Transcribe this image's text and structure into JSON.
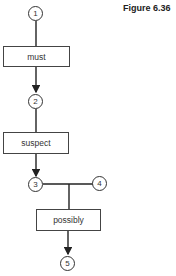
{
  "figure": {
    "title": "Figure 6.36"
  },
  "nodes": [
    {
      "id": "1",
      "label": "1"
    },
    {
      "id": "2",
      "label": "2"
    },
    {
      "id": "3",
      "label": "3"
    },
    {
      "id": "4",
      "label": "4"
    },
    {
      "id": "5",
      "label": "5"
    }
  ],
  "boxes": [
    {
      "label": "must"
    },
    {
      "label": "suspect"
    },
    {
      "label": "possibly"
    }
  ],
  "edges": [
    {
      "from": "1",
      "to": "must",
      "arrow": false
    },
    {
      "from": "must",
      "to": "2",
      "arrow": true
    },
    {
      "from": "2",
      "to": "suspect",
      "arrow": false
    },
    {
      "from": "suspect",
      "to": "3",
      "arrow": true
    },
    {
      "from": "3",
      "to": "4",
      "arrow": false
    },
    {
      "from": "3-4 junction",
      "to": "possibly",
      "arrow": false
    },
    {
      "from": "possibly",
      "to": "5",
      "arrow": true
    }
  ]
}
